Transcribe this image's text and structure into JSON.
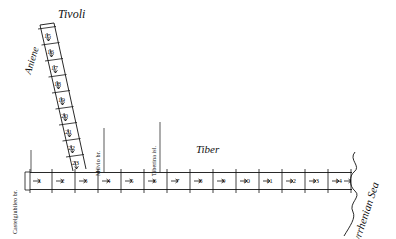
{
  "figure": {
    "type": "schematic-map",
    "title_labels": {
      "tivoli": "Tivoli",
      "aniene": "Aniene",
      "tiber": "Tiber",
      "tyrrhenian_sea": "Tyrrhenian Sea"
    },
    "landmarks": [
      {
        "name": "Castelgiubileo br.",
        "axis": "tiber",
        "position_mile": 0.6
      },
      {
        "name": "Milvio br.",
        "axis": "tiber",
        "position_mile": 4.0
      },
      {
        "name": "Tiberina isl.",
        "axis": "tiber",
        "position_mile": 6.5
      }
    ],
    "tiber_axis": {
      "label": "Tiber",
      "mile_markers": [
        "1",
        "2",
        "3",
        "4",
        "5",
        "6",
        "7",
        "8",
        "9",
        "10",
        "11",
        "12",
        "13",
        "14"
      ],
      "direction_marker": "arrow",
      "start_end": "Castelgiubileo br.",
      "finish_end": "Tyrrhenian Sea"
    },
    "aniene_axis": {
      "label": "Aniene",
      "mile_markers": [
        "15",
        "16",
        "17",
        "18",
        "19",
        "20",
        "21",
        "22",
        "23"
      ],
      "upstream_end": "Tivoli",
      "downstream_end": "confluence with Tiber"
    },
    "colors": {
      "ink": "#111111",
      "paper": "#ffffff"
    }
  }
}
